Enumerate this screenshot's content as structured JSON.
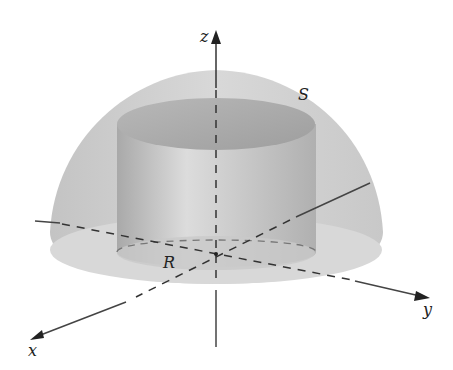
{
  "figure": {
    "labels": {
      "z_axis": "z",
      "x_axis": "x",
      "y_axis": "y",
      "surface": "S",
      "region": "R"
    },
    "colors": {
      "hemisphere_fill": "#c8c8c8",
      "cylinder_fill": "#b5b5b5",
      "cylinder_top": "#a8a8a8",
      "base_disk": "#d6d6d6",
      "axis": "#333333"
    }
  }
}
